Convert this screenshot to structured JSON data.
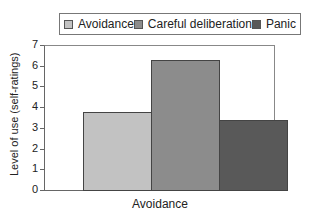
{
  "chart_data": {
    "type": "bar",
    "title": "",
    "categories": [
      "Avoidance"
    ],
    "series": [
      {
        "name": "Avoidance",
        "values": [
          3.75
        ],
        "color": "#c2c2c2"
      },
      {
        "name": "Careful deliberation",
        "values": [
          6.3
        ],
        "color": "#8c8c8c"
      },
      {
        "name": "Panic",
        "values": [
          3.4
        ],
        "color": "#595959"
      }
    ],
    "xlabel": "Avoidance",
    "ylabel": "Level of use (self-ratings)",
    "ylim": [
      0,
      7
    ],
    "yticks": [
      "0",
      "1",
      "2",
      "3",
      "4",
      "5",
      "6",
      "7"
    ],
    "grid": false,
    "legend_position": "top"
  },
  "legend": {
    "items": [
      {
        "label": "Avoidance",
        "color": "#c2c2c2"
      },
      {
        "label": "Careful deliberation",
        "color": "#8c8c8c"
      },
      {
        "label": "Panic",
        "color": "#595959"
      }
    ]
  },
  "axes": {
    "ylabel": "Level of use (self-ratings)",
    "xlabel": "Avoidance",
    "yticks": [
      "0",
      "1",
      "2",
      "3",
      "4",
      "5",
      "6",
      "7"
    ]
  }
}
